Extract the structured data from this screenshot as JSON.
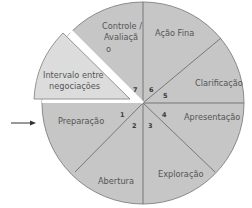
{
  "diagram": {
    "type": "circular-process-wheel",
    "colors": {
      "sector_fill": "#c6c6c6",
      "pulled_wedge_fill": "#dcdcdc",
      "divider": "#6e6e6e",
      "outline": "#8a8a8a",
      "text": "#555555",
      "arrow": "#333333"
    },
    "entry_arrow": {
      "target": "Preparação"
    },
    "pulled_out_wedge": {
      "line1": "Intervalo entre",
      "line2": "negociações"
    },
    "sectors": [
      {
        "number": "1",
        "label": "Preparação"
      },
      {
        "number": "2",
        "label": "Abertura"
      },
      {
        "number": "3",
        "label": "Exploração"
      },
      {
        "number": "4",
        "label": "Apresentação"
      },
      {
        "number": "5",
        "label": "Clarificação"
      },
      {
        "number": "6",
        "label": "Ação Final",
        "label_display": "Ação Fina"
      },
      {
        "number": "7",
        "label_line1": "Controle /",
        "label_line2": "Avaliaçã",
        "label_line3": "o"
      }
    ]
  }
}
